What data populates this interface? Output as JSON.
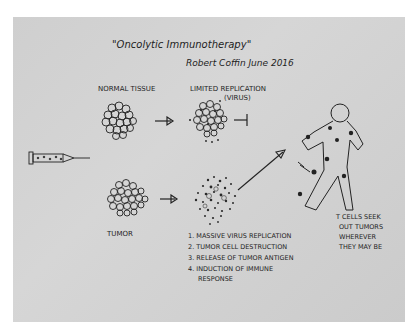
{
  "title": "\"Oncolytic Immunotherapy\"",
  "signature": "Robert Coffin June 2016",
  "labels": {
    "normal_tissue": "NORMAL TISSUE",
    "limited_replication": "LIMITED REPLICATION",
    "limited_replication_sub": "(VIRUS)",
    "tumor": "TUMOR"
  },
  "steps": [
    "1. MASSIVE VIRUS REPLICATION",
    "2. TUMOR CELL DESTRUCTION",
    "3. RELEASE OF TUMOR ANTIGEN",
    "4. INDUCTION OF IMMUNE",
    "RESPONSE"
  ],
  "tcell_note": [
    "T CELLS SEEK",
    "OUT TUMORS",
    "WHEREVER",
    "THEY MAY BE"
  ],
  "colors": {
    "paper": "#d0d0d0",
    "ink": "#1e1e1e",
    "background": "#ffffff"
  }
}
